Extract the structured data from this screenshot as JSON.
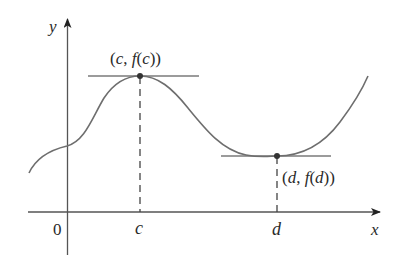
{
  "figure": {
    "axes": {
      "x_label": "x",
      "y_label": "y",
      "origin_label": "0"
    },
    "ticks": [
      {
        "label": "c"
      },
      {
        "label": "d"
      }
    ],
    "points": {
      "max": {
        "label": "(c, f(c))",
        "parts": [
          "(",
          "c",
          ", ",
          "f",
          "(",
          "c",
          "))"
        ]
      },
      "min": {
        "label": "(d, f(d))",
        "parts": [
          "(",
          "d",
          ", ",
          "f",
          "(",
          "d",
          "))"
        ]
      }
    },
    "colors": {
      "curve": "#6e6e6e",
      "axis": "#555555",
      "tangent": "#7a7a7a",
      "point": "#333333",
      "text": "#2a2a2a"
    }
  }
}
